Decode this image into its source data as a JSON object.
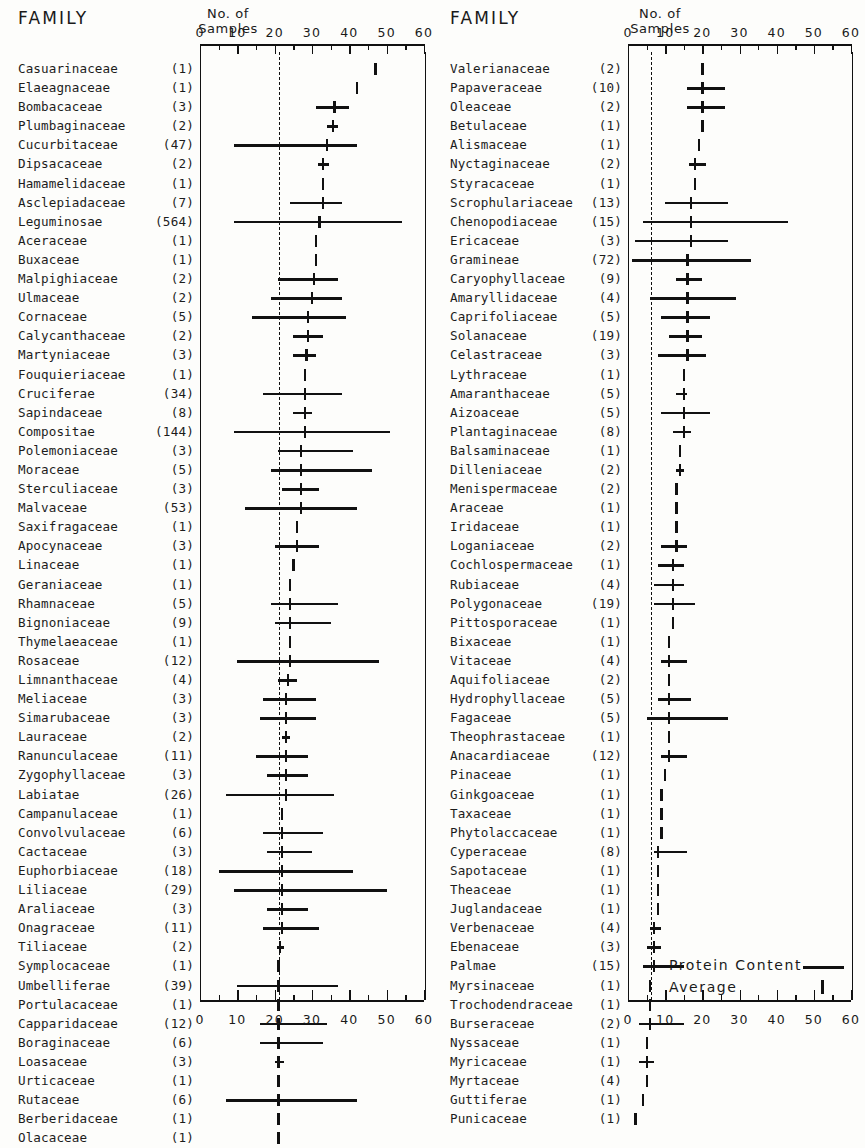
{
  "figure": {
    "headers": {
      "family": "FAMILY",
      "samples_line1": "No.  of",
      "samples_line2": "Samples"
    },
    "legend": {
      "protein_label": "Protein  Content",
      "average_label": "Average"
    },
    "axis_ticks": [
      "0",
      "10",
      "20",
      "30",
      "40",
      "50",
      "60"
    ]
  },
  "chart_data": {
    "type": "bar",
    "xlabel": "Protein Content (%)",
    "ylabel": "Family",
    "xlim": [
      0,
      60
    ],
    "grid": false,
    "legend_position": "bottom-right",
    "tick_labels": [
      "0",
      "10",
      "20",
      "30",
      "40",
      "50",
      "60"
    ],
    "series_description": "Horizontal line = protein content range; vertical tick = average",
    "panels": [
      {
        "name": "left-panel",
        "grand_mean": 21,
        "rows": [
          {
            "family": "Casuarinaceae",
            "n": "(1)",
            "avg": 47,
            "low": 47,
            "high": 47
          },
          {
            "family": "Elaeagnaceae",
            "n": "(1)",
            "avg": 42,
            "low": 42,
            "high": 42
          },
          {
            "family": "Bombacaceae",
            "n": "(3)",
            "avg": 36,
            "low": 31,
            "high": 40
          },
          {
            "family": "Plumbaginaceae",
            "n": "(2)",
            "avg": 35.5,
            "low": 34,
            "high": 37
          },
          {
            "family": "Cucurbitaceae",
            "n": "(47)",
            "avg": 34,
            "low": 9,
            "high": 42
          },
          {
            "family": "Dipsacaceae",
            "n": "(2)",
            "avg": 33,
            "low": 31.5,
            "high": 34.5
          },
          {
            "family": "Hamamelidaceae",
            "n": "(1)",
            "avg": 33,
            "low": 33,
            "high": 33
          },
          {
            "family": "Asclepiadaceae",
            "n": "(7)",
            "avg": 33,
            "low": 24,
            "high": 38
          },
          {
            "family": "Leguminosae",
            "n": "(564)",
            "avg": 32,
            "low": 9,
            "high": 54
          },
          {
            "family": "Aceraceae",
            "n": "(1)",
            "avg": 31,
            "low": 31,
            "high": 31
          },
          {
            "family": "Buxaceae",
            "n": "(1)",
            "avg": 31,
            "low": 31,
            "high": 31
          },
          {
            "family": "Malpighiaceae",
            "n": "(2)",
            "avg": 30.5,
            "low": 21,
            "high": 37
          },
          {
            "family": "Ulmaceae",
            "n": "(2)",
            "avg": 30,
            "low": 19,
            "high": 38
          },
          {
            "family": "Cornaceae",
            "n": "(5)",
            "avg": 29,
            "low": 14,
            "high": 39
          },
          {
            "family": "Calycanthaceae",
            "n": "(2)",
            "avg": 29,
            "low": 25,
            "high": 33
          },
          {
            "family": "Martyniaceae",
            "n": "(3)",
            "avg": 28.5,
            "low": 25,
            "high": 31
          },
          {
            "family": "Fouquieriaceae",
            "n": "(1)",
            "avg": 28,
            "low": 28,
            "high": 28
          },
          {
            "family": "Cruciferae",
            "n": "(34)",
            "avg": 28,
            "low": 17,
            "high": 38
          },
          {
            "family": "Sapindaceae",
            "n": "(8)",
            "avg": 28,
            "low": 25,
            "high": 30
          },
          {
            "family": "Compositae",
            "n": "(144)",
            "avg": 28,
            "low": 9,
            "high": 51
          },
          {
            "family": "Polemoniaceae",
            "n": "(3)",
            "avg": 27,
            "low": 21,
            "high": 41
          },
          {
            "family": "Moraceae",
            "n": "(5)",
            "avg": 27,
            "low": 19,
            "high": 46
          },
          {
            "family": "Sterculiaceae",
            "n": "(3)",
            "avg": 27,
            "low": 22,
            "high": 32
          },
          {
            "family": "Malvaceae",
            "n": "(53)",
            "avg": 27,
            "low": 12,
            "high": 42
          },
          {
            "family": "Saxifragaceae",
            "n": "(1)",
            "avg": 26,
            "low": 26,
            "high": 26
          },
          {
            "family": "Apocynaceae",
            "n": "(3)",
            "avg": 26,
            "low": 20,
            "high": 32
          },
          {
            "family": "Linaceae",
            "n": "(1)",
            "avg": 25,
            "low": 25,
            "high": 25
          },
          {
            "family": "Geraniaceae",
            "n": "(1)",
            "avg": 24,
            "low": 24,
            "high": 24
          },
          {
            "family": "Rhamnaceae",
            "n": "(5)",
            "avg": 24,
            "low": 19,
            "high": 37
          },
          {
            "family": "Bignoniaceae",
            "n": "(9)",
            "avg": 24,
            "low": 20,
            "high": 35
          },
          {
            "family": "Thymelaeaceae",
            "n": "(1)",
            "avg": 24,
            "low": 24,
            "high": 24
          },
          {
            "family": "Rosaceae",
            "n": "(12)",
            "avg": 24,
            "low": 10,
            "high": 48
          },
          {
            "family": "Limnanthaceae",
            "n": "(4)",
            "avg": 23.5,
            "low": 21,
            "high": 26
          },
          {
            "family": "Meliaceae",
            "n": "(3)",
            "avg": 23,
            "low": 17,
            "high": 31
          },
          {
            "family": "Simarubaceae",
            "n": "(3)",
            "avg": 23,
            "low": 16,
            "high": 31
          },
          {
            "family": "Lauraceae",
            "n": "(2)",
            "avg": 23,
            "low": 22,
            "high": 24
          },
          {
            "family": "Ranunculaceae",
            "n": "(11)",
            "avg": 23,
            "low": 15,
            "high": 29
          },
          {
            "family": "Zygophyllaceae",
            "n": "(3)",
            "avg": 23,
            "low": 18,
            "high": 29
          },
          {
            "family": "Labiatae",
            "n": "(26)",
            "avg": 23,
            "low": 7,
            "high": 36
          },
          {
            "family": "Campanulaceae",
            "n": "(1)",
            "avg": 22,
            "low": 22,
            "high": 22
          },
          {
            "family": "Convolvulaceae",
            "n": "(6)",
            "avg": 22,
            "low": 17,
            "high": 33
          },
          {
            "family": "Cactaceae",
            "n": "(3)",
            "avg": 22,
            "low": 18,
            "high": 30
          },
          {
            "family": "Euphorbiaceae",
            "n": "(18)",
            "avg": 22,
            "low": 5,
            "high": 41
          },
          {
            "family": "Liliaceae",
            "n": "(29)",
            "avg": 22,
            "low": 9,
            "high": 50
          },
          {
            "family": "Araliaceae",
            "n": "(3)",
            "avg": 22,
            "low": 18,
            "high": 29
          },
          {
            "family": "Onagraceae",
            "n": "(11)",
            "avg": 22,
            "low": 17,
            "high": 32
          },
          {
            "family": "Tiliaceae",
            "n": "(2)",
            "avg": 21.5,
            "low": 20.5,
            "high": 22.5
          },
          {
            "family": "Symplocaceae",
            "n": "(1)",
            "avg": 21,
            "low": 21,
            "high": 21
          },
          {
            "family": "Umbelliferae",
            "n": "(39)",
            "avg": 21,
            "low": 10,
            "high": 37
          },
          {
            "family": "Portulacaceae",
            "n": "(1)",
            "avg": 21,
            "low": 21,
            "high": 21
          },
          {
            "family": "Capparidaceae",
            "n": "(12)",
            "avg": 21,
            "low": 16,
            "high": 34
          },
          {
            "family": "Boraginaceae",
            "n": "(6)",
            "avg": 21,
            "low": 16,
            "high": 33
          },
          {
            "family": "Loasaceae",
            "n": "(3)",
            "avg": 21,
            "low": 20,
            "high": 22.5
          },
          {
            "family": "Urticaceae",
            "n": "(1)",
            "avg": 21,
            "low": 21,
            "high": 21
          },
          {
            "family": "Rutaceae",
            "n": "(6)",
            "avg": 21,
            "low": 7,
            "high": 42
          },
          {
            "family": "Berberidaceae",
            "n": "(1)",
            "avg": 21,
            "low": 21,
            "high": 21
          },
          {
            "family": "Olacaceae",
            "n": "(1)",
            "avg": 21,
            "low": 21,
            "high": 21
          }
        ]
      },
      {
        "name": "right-panel",
        "grand_mean": 6,
        "rows": [
          {
            "family": "Valerianaceae",
            "n": "(2)",
            "avg": 20,
            "low": 20,
            "high": 20
          },
          {
            "family": "Papaveraceae",
            "n": "(10)",
            "avg": 20,
            "low": 16,
            "high": 26
          },
          {
            "family": "Oleaceae",
            "n": "(2)",
            "avg": 20,
            "low": 16,
            "high": 26
          },
          {
            "family": "Betulaceae",
            "n": "(1)",
            "avg": 20,
            "low": 20,
            "high": 20
          },
          {
            "family": "Alismaceae",
            "n": "(1)",
            "avg": 19,
            "low": 19,
            "high": 19
          },
          {
            "family": "Nyctaginaceae",
            "n": "(2)",
            "avg": 18,
            "low": 16.5,
            "high": 21
          },
          {
            "family": "Styracaceae",
            "n": "(1)",
            "avg": 18,
            "low": 18,
            "high": 18
          },
          {
            "family": "Scrophulariaceae",
            "n": "(13)",
            "avg": 17,
            "low": 10,
            "high": 27
          },
          {
            "family": "Chenopodiaceae",
            "n": "(15)",
            "avg": 17,
            "low": 4,
            "high": 43
          },
          {
            "family": "Ericaceae",
            "n": "(3)",
            "avg": 17,
            "low": 2,
            "high": 27
          },
          {
            "family": "Gramineae",
            "n": "(72)",
            "avg": 16,
            "low": 1,
            "high": 33
          },
          {
            "family": "Caryophyllaceae",
            "n": "(9)",
            "avg": 16,
            "low": 13,
            "high": 20
          },
          {
            "family": "Amaryllidaceae",
            "n": "(4)",
            "avg": 16,
            "low": 6,
            "high": 29
          },
          {
            "family": "Caprifoliaceae",
            "n": "(5)",
            "avg": 16,
            "low": 9,
            "high": 22
          },
          {
            "family": "Solanaceae",
            "n": "(19)",
            "avg": 16,
            "low": 11,
            "high": 20
          },
          {
            "family": "Celastraceae",
            "n": "(3)",
            "avg": 16,
            "low": 8,
            "high": 21
          },
          {
            "family": "Lythraceae",
            "n": "(1)",
            "avg": 15,
            "low": 15,
            "high": 15
          },
          {
            "family": "Amaranthaceae",
            "n": "(5)",
            "avg": 15,
            "low": 13,
            "high": 16
          },
          {
            "family": "Aizoaceae",
            "n": "(5)",
            "avg": 15,
            "low": 9,
            "high": 22
          },
          {
            "family": "Plantaginaceae",
            "n": "(8)",
            "avg": 15,
            "low": 12,
            "high": 17
          },
          {
            "family": "Balsaminaceae",
            "n": "(1)",
            "avg": 14,
            "low": 14,
            "high": 14
          },
          {
            "family": "Dilleniaceae",
            "n": "(2)",
            "avg": 14,
            "low": 13,
            "high": 15
          },
          {
            "family": "Menispermaceae",
            "n": "(2)",
            "avg": 13,
            "low": 13,
            "high": 13
          },
          {
            "family": "Araceae",
            "n": "(1)",
            "avg": 13,
            "low": 13,
            "high": 13
          },
          {
            "family": "Iridaceae",
            "n": "(1)",
            "avg": 13,
            "low": 13,
            "high": 13
          },
          {
            "family": "Loganiaceae",
            "n": "(2)",
            "avg": 13,
            "low": 9,
            "high": 16
          },
          {
            "family": "Cochlospermaceae",
            "n": "(1)",
            "avg": 12,
            "low": 8,
            "high": 15
          },
          {
            "family": "Rubiaceae",
            "n": "(4)",
            "avg": 12,
            "low": 7,
            "high": 15
          },
          {
            "family": "Polygonaceae",
            "n": "(19)",
            "avg": 12,
            "low": 7,
            "high": 18
          },
          {
            "family": "Pittosporaceae",
            "n": "(1)",
            "avg": 12,
            "low": 12,
            "high": 12
          },
          {
            "family": "Bixaceae",
            "n": "(1)",
            "avg": 11,
            "low": 11,
            "high": 11
          },
          {
            "family": "Vitaceae",
            "n": "(4)",
            "avg": 11,
            "low": 9,
            "high": 16
          },
          {
            "family": "Aquifoliaceae",
            "n": "(2)",
            "avg": 11,
            "low": 11,
            "high": 11
          },
          {
            "family": "Hydrophyllaceae",
            "n": "(5)",
            "avg": 11,
            "low": 8,
            "high": 17
          },
          {
            "family": "Fagaceae",
            "n": "(5)",
            "avg": 11,
            "low": 5,
            "high": 27
          },
          {
            "family": "Theophrastaceae",
            "n": "(1)",
            "avg": 11,
            "low": 11,
            "high": 11
          },
          {
            "family": "Anacardiaceae",
            "n": "(12)",
            "avg": 11,
            "low": 9,
            "high": 16
          },
          {
            "family": "Pinaceae",
            "n": "(1)",
            "avg": 10,
            "low": 10,
            "high": 10
          },
          {
            "family": "Ginkgoaceae",
            "n": "(1)",
            "avg": 9,
            "low": 9,
            "high": 9
          },
          {
            "family": "Taxaceae",
            "n": "(1)",
            "avg": 9,
            "low": 9,
            "high": 9
          },
          {
            "family": "Phytolaccaceae",
            "n": "(1)",
            "avg": 9,
            "low": 9,
            "high": 9
          },
          {
            "family": "Cyperaceae",
            "n": "(8)",
            "avg": 8,
            "low": 7,
            "high": 16
          },
          {
            "family": "Sapotaceae",
            "n": "(1)",
            "avg": 8,
            "low": 8,
            "high": 8
          },
          {
            "family": "Theaceae",
            "n": "(1)",
            "avg": 8,
            "low": 8,
            "high": 8
          },
          {
            "family": "Juglandaceae",
            "n": "(1)",
            "avg": 8,
            "low": 8,
            "high": 8
          },
          {
            "family": "Verbenaceae",
            "n": "(4)",
            "avg": 7,
            "low": 6,
            "high": 9
          },
          {
            "family": "Ebenaceae",
            "n": "(3)",
            "avg": 7,
            "low": 5,
            "high": 9
          },
          {
            "family": "Palmae",
            "n": "(15)",
            "avg": 7,
            "low": 4,
            "high": 15
          },
          {
            "family": "Myrsinaceae",
            "n": "(1)",
            "avg": 6,
            "low": 6,
            "high": 6
          },
          {
            "family": "Trochodendraceae",
            "n": "(1)",
            "avg": 6,
            "low": 6,
            "high": 6
          },
          {
            "family": "Burseraceae",
            "n": "(2)",
            "avg": 6,
            "low": 3,
            "high": 15
          },
          {
            "family": "Nyssaceae",
            "n": "(1)",
            "avg": 5,
            "low": 5,
            "high": 5
          },
          {
            "family": "Myricaceae",
            "n": "(1)",
            "avg": 5,
            "low": 3,
            "high": 7
          },
          {
            "family": "Myrtaceae",
            "n": "(4)",
            "avg": 5,
            "low": 5,
            "high": 5
          },
          {
            "family": "Guttiferae",
            "n": "(1)",
            "avg": 4,
            "low": 4,
            "high": 4
          },
          {
            "family": "Punicaceae",
            "n": "(1)",
            "avg": 2,
            "low": 2,
            "high": 2
          }
        ]
      }
    ]
  }
}
